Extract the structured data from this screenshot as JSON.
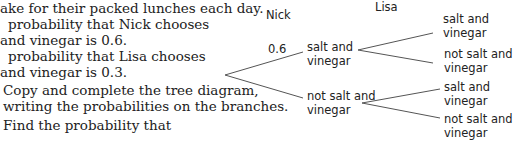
{
  "question": {
    "lines": [
      "ake for their packed lunches each day.",
      "probability that Nick chooses",
      "and vinegar is 0.6.",
      "probability that Lisa chooses",
      "and vinegar is 0.3.",
      "Copy and complete the tree diagram,",
      "writing the probabilities on the branches.",
      "Find the probability that"
    ]
  },
  "tree": {
    "headers": {
      "first": "Nick",
      "second": "Lisa"
    },
    "first_branch_probability": "0.6",
    "first_level": [
      {
        "line1": "salt and",
        "line2": "vinegar"
      },
      {
        "line1": "not salt and",
        "line2": "vinegar"
      }
    ],
    "second_level": [
      {
        "line1": "salt and",
        "line2": "vinegar"
      },
      {
        "line1": "not salt and",
        "line2": "vinegar"
      },
      {
        "line1": "salt and",
        "line2": "vinegar"
      },
      {
        "line1": "not salt and",
        "line2": "vinegar"
      }
    ]
  }
}
